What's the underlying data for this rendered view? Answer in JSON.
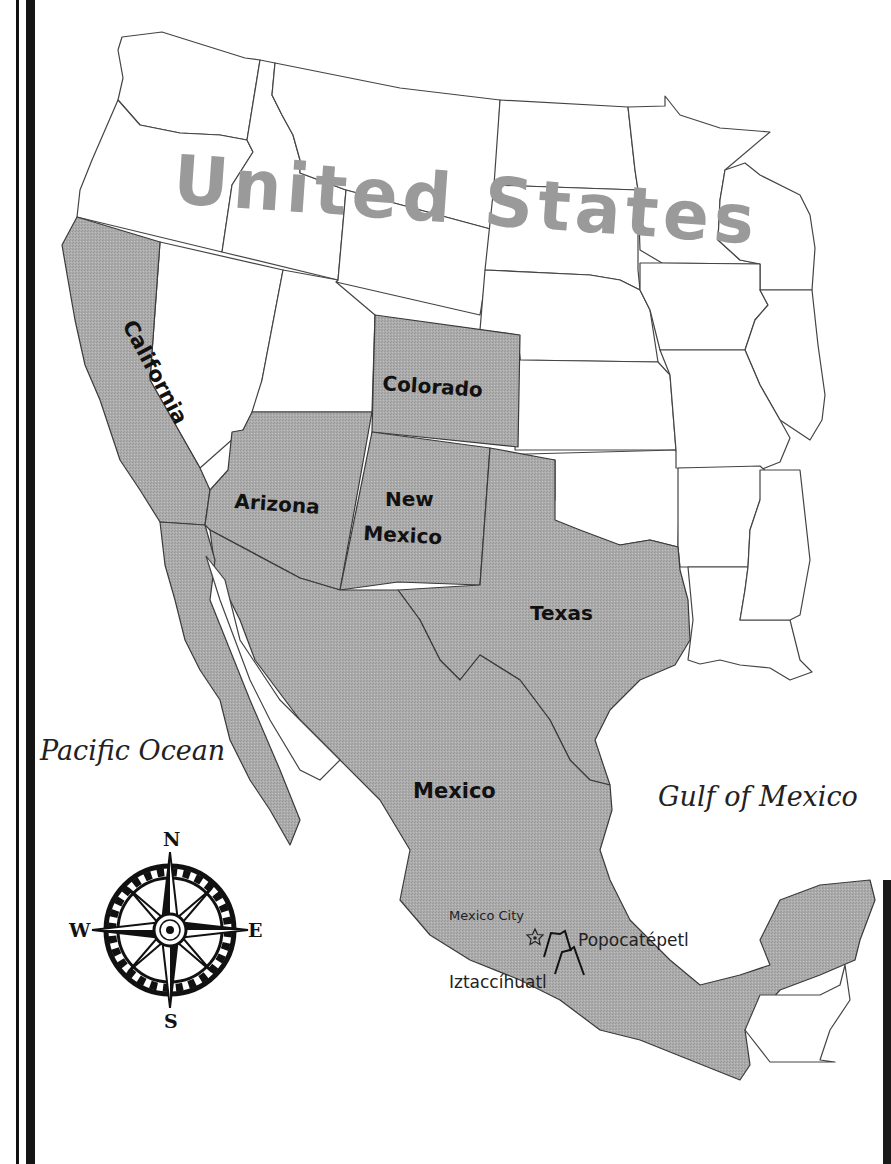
{
  "map": {
    "title": "United States",
    "colors": {
      "ceded_fill": "#a8a8a8",
      "us_label": "#9a9a9a",
      "outline": "#444444",
      "background": "#ffffff"
    },
    "state_labels": {
      "california": "California",
      "colorado": "Colorado",
      "arizona": "Arizona",
      "new_mexico_line1": "New",
      "new_mexico_line2": "Mexico",
      "texas": "Texas"
    },
    "country_labels": {
      "united_states": "United States",
      "mexico": "Mexico"
    },
    "water_labels": {
      "pacific": "Pacific Ocean",
      "gulf": "Gulf of Mexico"
    },
    "places": {
      "capital": "Mexico City",
      "volcano_1": "Popocatépetl",
      "volcano_2": "Iztaccíhuatl"
    },
    "compass": {
      "north": "N",
      "south": "S",
      "east": "E",
      "west": "W",
      "icon": "compass-rose-icon"
    }
  }
}
